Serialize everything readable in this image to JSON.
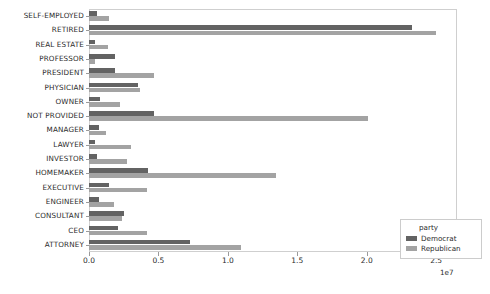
{
  "chart_data": {
    "type": "bar",
    "orientation": "horizontal",
    "title": "",
    "xlabel": "",
    "ylabel": "contbr_occupation",
    "x_offset_text": "1e7",
    "xlim": [
      0,
      26500000
    ],
    "xticks": [
      0,
      5000000,
      10000000,
      15000000,
      20000000,
      25000000
    ],
    "xticklabels": [
      "0.0",
      "0.5",
      "1.0",
      "1.5",
      "2.0",
      "2.5"
    ],
    "grid": false,
    "legend": {
      "title": "party",
      "position": "lower right",
      "entries": [
        {
          "name": "Democrat",
          "color": "#636363"
        },
        {
          "name": "Republican",
          "color": "#a3a3a3"
        }
      ]
    },
    "categories": [
      "SELF-EMPLOYED",
      "RETIRED",
      "REAL ESTATE",
      "PROFESSOR",
      "PRESIDENT",
      "PHYSICIAN",
      "OWNER",
      "NOT PROVIDED",
      "MANAGER",
      "LAWYER",
      "INVESTOR",
      "HOMEMAKER",
      "EXECUTIVE",
      "ENGINEER",
      "CONSULTANT",
      "CEO",
      "ATTORNEY"
    ],
    "series": [
      {
        "name": "Democrat",
        "color": "#636363",
        "values": [
          550000,
          23250000,
          450000,
          1900000,
          1900000,
          3550000,
          800000,
          4650000,
          700000,
          400000,
          600000,
          4250000,
          1450000,
          700000,
          2500000,
          2100000,
          7300000
        ]
      },
      {
        "name": "Republican",
        "color": "#a3a3a3",
        "values": [
          1450000,
          25000000,
          1400000,
          400000,
          4700000,
          3700000,
          2250000,
          20100000,
          1200000,
          3050000,
          2750000,
          13450000,
          4150000,
          1800000,
          2350000,
          4200000,
          10950000
        ]
      }
    ]
  }
}
